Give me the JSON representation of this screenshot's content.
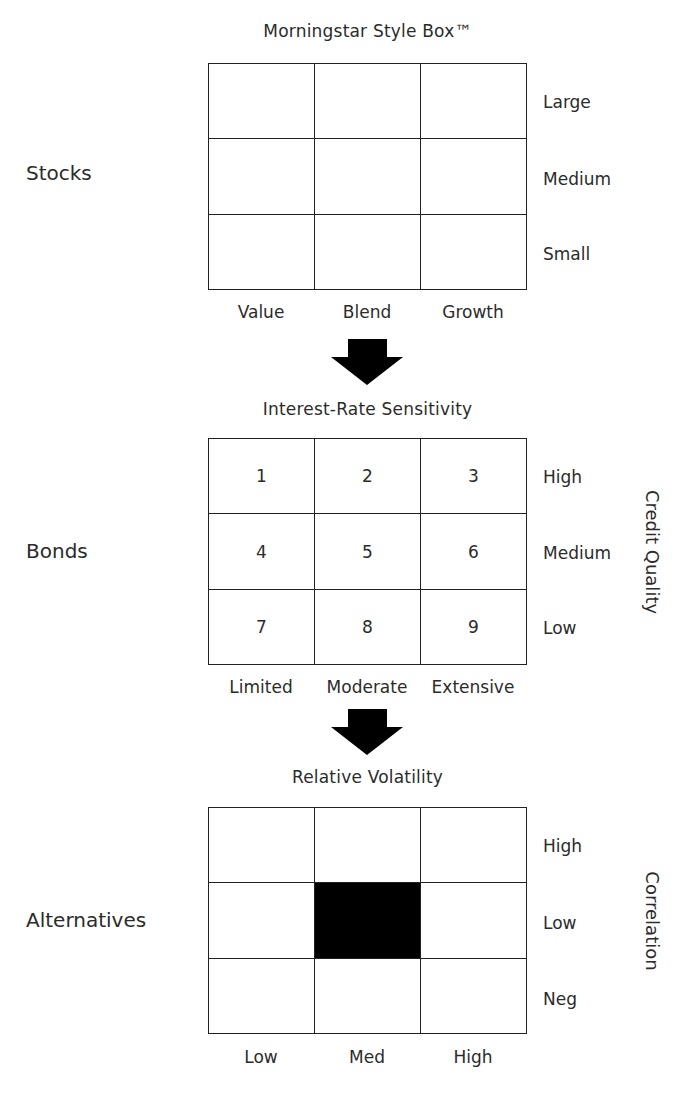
{
  "diagram": {
    "sections": [
      {
        "id": "stocks",
        "group_label": "Stocks",
        "title": "Morningstar Style Box™",
        "row_labels": [
          "Large",
          "Medium",
          "Small"
        ],
        "col_labels": [
          "Value",
          "Blend",
          "Growth"
        ],
        "vertical_axis_label": "",
        "cells": [
          [
            "",
            "",
            ""
          ],
          [
            "",
            "",
            ""
          ],
          [
            "",
            "",
            ""
          ]
        ],
        "filled_cell": null
      },
      {
        "id": "bonds",
        "group_label": "Bonds",
        "title": "Interest-Rate Sensitivity",
        "row_labels": [
          "High",
          "Medium",
          "Low"
        ],
        "col_labels": [
          "Limited",
          "Moderate",
          "Extensive"
        ],
        "vertical_axis_label": "Credit Quality",
        "cells": [
          [
            "1",
            "2",
            "3"
          ],
          [
            "4",
            "5",
            "6"
          ],
          [
            "7",
            "8",
            "9"
          ]
        ],
        "filled_cell": null
      },
      {
        "id": "alternatives",
        "group_label": "Alternatives",
        "title": "Relative Volatility",
        "row_labels": [
          "High",
          "Low",
          "Neg"
        ],
        "col_labels": [
          "Low",
          "Med",
          "High"
        ],
        "vertical_axis_label": "Correlation",
        "cells": [
          [
            "",
            "",
            ""
          ],
          [
            "",
            "",
            ""
          ],
          [
            "",
            "",
            ""
          ]
        ],
        "filled_cell": {
          "row": 2,
          "col": 2
        }
      }
    ],
    "arrows": [
      {
        "from": "stocks",
        "to": "bonds",
        "direction": "down"
      },
      {
        "from": "bonds",
        "to": "alternatives",
        "direction": "down"
      }
    ],
    "colors": {
      "line": "#222222",
      "text": "#2b2b2b",
      "fill": "#000000",
      "background": "#ffffff"
    }
  }
}
